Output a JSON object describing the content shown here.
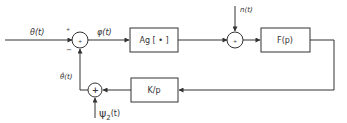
{
  "diagram": {
    "type": "block-diagram",
    "colors": {
      "line": "#333333",
      "background": "#ffffff"
    },
    "signals": {
      "input": "θ(t)",
      "error": "φ(t)",
      "noise": "n(t)",
      "estimate": "θ̂(t)",
      "disturbance_symbol": "ψ",
      "disturbance_sub": "2",
      "disturbance_arg": "(t)"
    },
    "junction_signs": {
      "sum1_top": "+",
      "sum1_bottom": "−",
      "sum1_center": "+",
      "sum2_center": "+",
      "sum3_center": "+"
    },
    "blocks": {
      "nonlinearity": "Ag [ • ]",
      "filter": "F(p)",
      "integrator": "K/p"
    }
  }
}
